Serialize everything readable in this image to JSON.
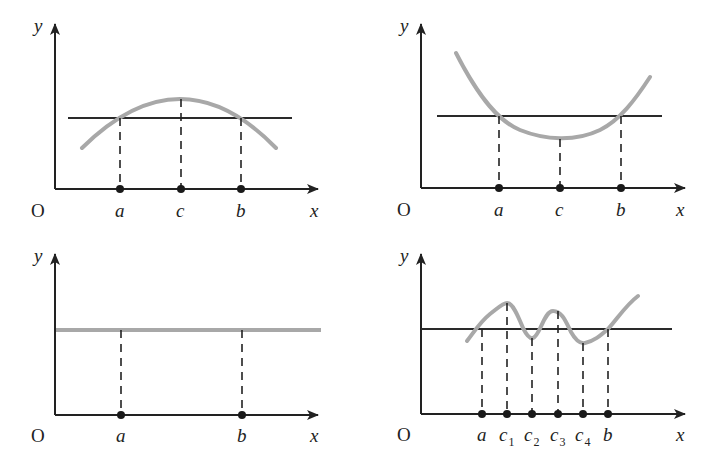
{
  "figure": {
    "panels": [
      {
        "id": "top-left",
        "description": "Concave-down curve with maximum at c between a and b",
        "axis_labels": {
          "y": "y",
          "x": "x",
          "origin": "O"
        },
        "points": [
          "a",
          "c",
          "b"
        ]
      },
      {
        "id": "top-right",
        "description": "Concave-up curve with minimum at c between a and b",
        "axis_labels": {
          "y": "y",
          "x": "x",
          "origin": "O"
        },
        "points": [
          "a",
          "c",
          "b"
        ]
      },
      {
        "id": "bottom-left",
        "description": "Constant function on [a, b]",
        "axis_labels": {
          "y": "y",
          "x": "x",
          "origin": "O"
        },
        "points": [
          "a",
          "b"
        ]
      },
      {
        "id": "bottom-right",
        "description": "Oscillating curve with extrema c1..c4 between a and b",
        "axis_labels": {
          "y": "y",
          "x": "x",
          "origin": "O"
        },
        "points": [
          "a",
          "c",
          "c",
          "c",
          "c",
          "b"
        ],
        "subscripts": [
          "",
          "1",
          "2",
          "3",
          "4",
          ""
        ]
      }
    ],
    "colors": {
      "axis": "#222222",
      "curve": "#a8a8a8",
      "reference_line": "#2a2a2a"
    }
  }
}
